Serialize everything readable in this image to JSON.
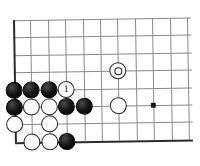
{
  "diagram": {
    "kind": "go-board-diagram",
    "title": "",
    "board": {
      "columns": 11,
      "rows": 8,
      "origin_x": 14,
      "origin_y": 19,
      "spacing": 17.4,
      "line_color": "#8a8a8a",
      "edge_color": "#2b2b2b",
      "background": "#ffffff",
      "bottom_edge_row": 7,
      "left_edge_col": 0
    },
    "hoshi": [
      {
        "col": 8,
        "row": 5
      }
    ],
    "stones": [
      {
        "col": 6,
        "row": 3,
        "color": "white",
        "mark": "circle",
        "label": ""
      },
      {
        "col": 0,
        "row": 4,
        "color": "black",
        "mark": "",
        "label": ""
      },
      {
        "col": 1,
        "row": 4,
        "color": "black",
        "mark": "",
        "label": ""
      },
      {
        "col": 2,
        "row": 4,
        "color": "black",
        "mark": "",
        "label": ""
      },
      {
        "col": 3,
        "row": 4,
        "color": "white",
        "mark": "",
        "label": "1"
      },
      {
        "col": 0,
        "row": 5,
        "color": "black",
        "mark": "",
        "label": ""
      },
      {
        "col": 1,
        "row": 5,
        "color": "white",
        "mark": "",
        "label": ""
      },
      {
        "col": 2,
        "row": 5,
        "color": "white",
        "mark": "",
        "label": ""
      },
      {
        "col": 3,
        "row": 5,
        "color": "black",
        "mark": "",
        "label": ""
      },
      {
        "col": 4,
        "row": 5,
        "color": "black",
        "mark": "",
        "label": ""
      },
      {
        "col": 6,
        "row": 5,
        "color": "white",
        "mark": "",
        "label": ""
      },
      {
        "col": 0,
        "row": 6,
        "color": "white",
        "mark": "",
        "label": ""
      },
      {
        "col": 2,
        "row": 6,
        "color": "white",
        "mark": "",
        "label": ""
      },
      {
        "col": 1,
        "row": 7,
        "color": "white",
        "mark": "",
        "label": ""
      },
      {
        "col": 2,
        "row": 7,
        "color": "white",
        "mark": "",
        "label": ""
      },
      {
        "col": 3,
        "row": 7,
        "color": "black",
        "mark": "",
        "label": ""
      }
    ],
    "move_labels": [
      {
        "number": "1",
        "color": "white"
      }
    ]
  }
}
